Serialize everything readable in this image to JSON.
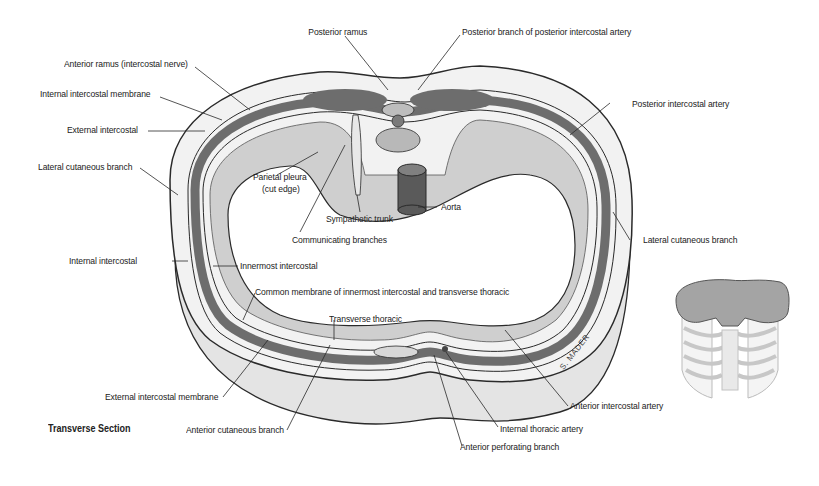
{
  "figure": {
    "caption": "Transverse Section",
    "signature": "S. MADER",
    "colors": {
      "muscle": "#6d6d6d",
      "skin": "#e6e6e6",
      "cavity": "#ffffff",
      "outline": "#2a2a2a",
      "aorta": "#5a5a5a"
    }
  },
  "labels": {
    "posterior_ramus": "Posterior ramus",
    "posterior_branch_posterior_intercostal_artery": "Posterior branch of posterior intercostal artery",
    "anterior_ramus": "Anterior ramus (intercostal nerve)",
    "internal_intercostal_membrane": "Internal intercostal membrane",
    "posterior_intercostal_artery": "Posterior intercostal artery",
    "external_intercostal": "External intercostal",
    "lateral_cutaneous_branch_left": "Lateral cutaneous branch",
    "parietal_pleura_1": "Parietal pleura",
    "parietal_pleura_2": "(cut edge)",
    "aorta": "Aorta",
    "sympathetic_trunk": "Sympathetic trunk",
    "communicating_branches": "Communicating branches",
    "lateral_cutaneous_branch_right": "Lateral cutaneous branch",
    "internal_intercostal": "Internal intercostal",
    "innermost_intercostal": "Innermost intercostal",
    "common_membrane": "Common membrane of innermost intercostal and transverse thoracic",
    "transverse_thoracic": "Transverse thoracic",
    "external_intercostal_membrane": "External intercostal membrane",
    "anterior_intercostal_artery": "Anterior intercostal artery",
    "internal_thoracic_artery": "Internal thoracic artery",
    "anterior_cutaneous_branch": "Anterior cutaneous branch",
    "anterior_perforating_branch": "Anterior perforating branch"
  }
}
